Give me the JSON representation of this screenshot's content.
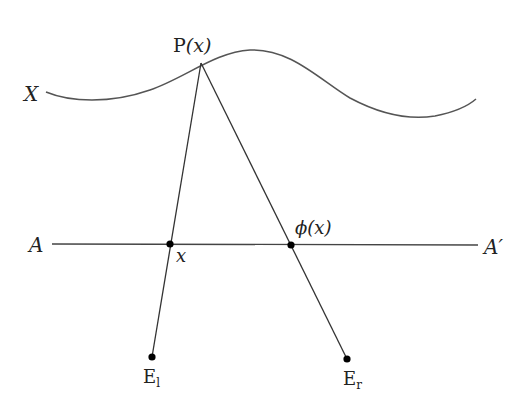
{
  "diagram": {
    "labels": {
      "surface": "X",
      "point_prefix": "P",
      "point_arg": "(x)",
      "line_left": "A",
      "line_right": "A′",
      "left_intersection": "x",
      "right_intersection_phi": "ϕ",
      "right_intersection_arg": "(x)",
      "left_eye_base": "E",
      "left_eye_sub": "l",
      "right_eye_base": "E",
      "right_eye_sub": "r"
    },
    "colors": {
      "curve": "#555555",
      "lines": "#333333",
      "points": "#000000",
      "text": "#222222",
      "background": "#ffffff"
    },
    "points": {
      "P": [
        201,
        63
      ],
      "x": [
        170,
        244
      ],
      "phi_x": [
        291,
        245
      ],
      "E_l": [
        152,
        357
      ],
      "E_r": [
        347,
        359
      ]
    }
  }
}
